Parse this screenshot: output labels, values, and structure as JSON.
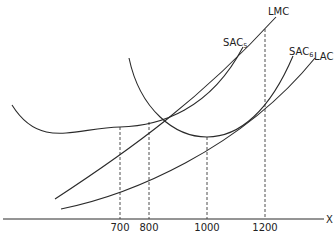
{
  "diagram": {
    "type": "cost-curves",
    "axis": {
      "x_label": "X"
    },
    "ticks": [
      {
        "label": "700",
        "x": 120
      },
      {
        "label": "800",
        "x": 149
      },
      {
        "label": "1000",
        "x": 207
      },
      {
        "label": "1200",
        "x": 265
      }
    ],
    "curves": [
      {
        "id": "LMC",
        "label": "LMC",
        "sub": ""
      },
      {
        "id": "SAC5",
        "label": "SAC",
        "sub": "5"
      },
      {
        "id": "SAC6",
        "label": "SAC",
        "sub": "6"
      },
      {
        "id": "LAC",
        "label": "LAC",
        "sub": ""
      }
    ]
  }
}
